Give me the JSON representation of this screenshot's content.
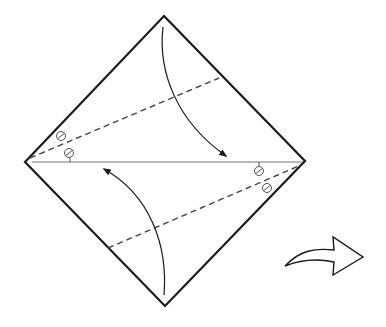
{
  "diagram": {
    "type": "origami-fold-step",
    "colors": {
      "outline": "#1a1a1a",
      "fold_line": "#444444",
      "crease": "#777777",
      "background": "#ffffff"
    },
    "paper": {
      "shape": "diamond",
      "vertices": {
        "top": [
          164,
          16
        ],
        "right": [
          305,
          161
        ],
        "bottom": [
          165,
          306
        ],
        "left": [
          25,
          162
        ]
      }
    },
    "center_crease": {
      "from": [
        32,
        162
      ],
      "to": [
        303,
        162
      ]
    },
    "valley_folds": [
      {
        "name": "upper",
        "from": [
          30,
          158
        ],
        "to": [
          219,
          78
        ]
      },
      {
        "name": "lower",
        "from": [
          108,
          248
        ],
        "to": [
          301,
          165
        ]
      }
    ],
    "fold_arrows": [
      {
        "name": "top-down",
        "from": [
          163,
          26
        ],
        "to": [
          228,
          157
        ]
      },
      {
        "name": "bottom-up",
        "from": [
          164,
          296
        ],
        "to": [
          102,
          168
        ]
      }
    ],
    "equal_angle_marks": [
      {
        "position": "left",
        "circles": [
          [
            61,
            136
          ],
          [
            69,
            153
          ]
        ]
      },
      {
        "position": "right",
        "circles": [
          [
            259,
            171
          ],
          [
            267,
            188
          ]
        ]
      }
    ],
    "turn_over_arrow": {
      "label": "turn over",
      "position": [
        285,
        235
      ]
    }
  }
}
